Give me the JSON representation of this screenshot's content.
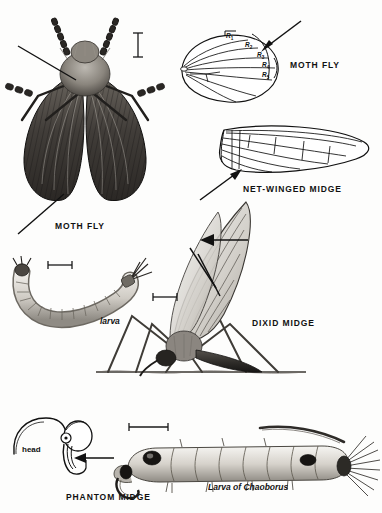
{
  "plate": {
    "title": "Diptera illustration plate",
    "background_color": "#fdfdfc",
    "ink_color": "#111111",
    "width": 382,
    "height": 513
  },
  "figures": [
    {
      "id": "moth-fly-habitus",
      "label": "MOTH FLY",
      "kind": "halftone-drawing",
      "description": "dorsal view of hairy moth fly with broad scaly wings and beaded antennae"
    },
    {
      "id": "moth-fly-wing",
      "label": "MOTH FLY",
      "kind": "line-drawing",
      "description": "leaf-shaped wing with parallel longitudinal veins",
      "vein_labels": [
        "R1",
        "R2",
        "R3",
        "R4",
        "R5"
      ]
    },
    {
      "id": "net-winged-midge-wing",
      "label": "NET-WINGED MIDGE",
      "kind": "line-drawing",
      "description": "elongate wing with network of fine fold lines"
    },
    {
      "id": "moth-fly-larva",
      "label": "larva",
      "kind": "halftone-drawing",
      "description": "curved segmented larva with terminal bristles"
    },
    {
      "id": "dixid-midge",
      "label": "DIXID MIDGE",
      "kind": "halftone-drawing",
      "description": "adult midge resting on water surface with raised wings and long legs"
    },
    {
      "id": "phantom-midge-head",
      "label": "PHANTOM MIDGE",
      "kind": "line-drawing",
      "description": "head of phantom midge larva with curved antenna and prehensile mouthparts",
      "part_label": "head"
    },
    {
      "id": "chaoborus-larva",
      "label": "Larva of Chaoborus",
      "kind": "halftone-drawing",
      "description": "transparent segmented larva with paired air sacs and caudal fan"
    }
  ],
  "labels": {
    "moth_fly_wing": "MOTH FLY",
    "net_winged_midge": "NET-WINGED MIDGE",
    "moth_fly_habitus": "MOTH FLY",
    "larva": "larva",
    "dixid_midge": "DIXID MIDGE",
    "phantom_midge": "PHANTOM MIDGE",
    "head": "head",
    "chaoborus": "Larva of Chaoborus"
  },
  "vein_labels": [
    {
      "name": "R",
      "sub": "1"
    },
    {
      "name": "R",
      "sub": "2"
    },
    {
      "name": "R",
      "sub": "3"
    },
    {
      "name": "R",
      "sub": "4"
    },
    {
      "name": "R",
      "sub": "5"
    }
  ],
  "scale_bars": [
    {
      "id": "scale-moth-fly",
      "orientation": "vertical"
    },
    {
      "id": "scale-larva",
      "orientation": "horizontal"
    },
    {
      "id": "scale-dixid",
      "orientation": "horizontal"
    },
    {
      "id": "scale-chaoborus",
      "orientation": "horizontal"
    }
  ],
  "pointers": [
    {
      "id": "pointer-moth-fly-wing",
      "target": "moth fly wing margin"
    },
    {
      "id": "pointer-moth-fly-vein",
      "target": "radial vein fork"
    },
    {
      "id": "pointer-net-winged-midge",
      "target": "wing fold lines"
    },
    {
      "id": "pointer-dixid-vein-1",
      "target": "dixid wing vein"
    },
    {
      "id": "pointer-dixid-vein-2",
      "target": "dixid wing vein"
    },
    {
      "id": "pointer-dixid-vein-3",
      "target": "dixid wing vein"
    },
    {
      "id": "pointer-phantom-mouthparts",
      "target": "prehensile antennae"
    }
  ]
}
